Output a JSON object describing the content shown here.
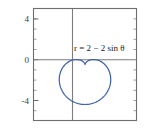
{
  "figure": {
    "name": "cardioid-plot",
    "background": "#ffffff",
    "frame_color": "#6e6e6e",
    "axis_color": "#7d7d7d",
    "curve_color": "#3f64ab",
    "tick_color": "#8a8a8a"
  },
  "annotation": {
    "equation": "r = 2 − 2 sin θ"
  },
  "chart_data": {
    "type": "line",
    "title": "",
    "subtitle": "",
    "xlabel": "",
    "ylabel": "",
    "annotations": [
      "r = 2 − 2 sin θ"
    ],
    "legend": [],
    "legend_position": "none",
    "grid": false,
    "polar_equation": "r = 2 - 2*sin(theta)",
    "curve_name": "cardioid",
    "xlim": [
      -5.2,
      5.2
    ],
    "ylim": [
      -5.6,
      5.6
    ],
    "x_ticks": [],
    "x_tick_labels": [],
    "y_ticks": [
      4,
      0,
      -4
    ],
    "y_tick_labels": [
      "4",
      "0",
      "-4"
    ],
    "y_minor_tick_step": 1,
    "series": [
      {
        "name": "r = 2 - 2 sin(theta)",
        "color": "#3f64ab",
        "closed": true,
        "points": [
          [
            0.0,
            0.0
          ],
          [
            0.431,
            -0.116
          ],
          [
            0.804,
            -0.431
          ],
          [
            1.085,
            -0.89
          ],
          [
            1.255,
            -1.427
          ],
          [
            1.309,
            -2.0
          ],
          [
            1.255,
            -2.573
          ],
          [
            1.085,
            -3.11
          ],
          [
            0.804,
            -3.569
          ],
          [
            0.431,
            -3.884
          ],
          [
            0.0,
            -4.0
          ],
          [
            -0.431,
            -3.884
          ],
          [
            -0.804,
            -3.569
          ],
          [
            -1.085,
            -3.11
          ],
          [
            -1.255,
            -2.573
          ],
          [
            -1.309,
            -2.0
          ],
          [
            -1.255,
            -1.427
          ],
          [
            -1.085,
            -0.89
          ],
          [
            -0.804,
            -0.431
          ],
          [
            -0.431,
            -0.116
          ],
          [
            0.0,
            0.0
          ]
        ],
        "cusp": [
          0,
          0
        ],
        "max_radius": 4,
        "max_abs_x": 2.598
      }
    ]
  }
}
